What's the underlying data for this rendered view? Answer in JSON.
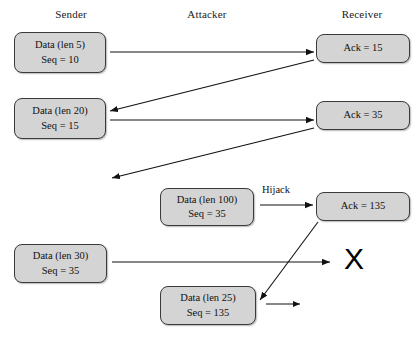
{
  "diagram": {
    "columns": [
      {
        "id": "sender",
        "label": "Sender",
        "x": 71,
        "y": 8
      },
      {
        "id": "attacker",
        "label": "Attacker",
        "x": 207,
        "y": 8
      },
      {
        "id": "receiver",
        "label": "Receiver",
        "x": 362,
        "y": 8
      }
    ],
    "boxes": [
      {
        "id": "sender-data-1",
        "line1": "Data (len 5)",
        "line2": "Seq = 10",
        "x": 14,
        "y": 32,
        "w": 92,
        "h": 41
      },
      {
        "id": "receiver-ack-1",
        "line1": "Ack = 15",
        "line2": "",
        "x": 316,
        "y": 34,
        "w": 94,
        "h": 29
      },
      {
        "id": "sender-data-2",
        "line1": "Data (len 20)",
        "line2": "Seq = 15",
        "x": 14,
        "y": 98,
        "w": 92,
        "h": 41
      },
      {
        "id": "receiver-ack-2",
        "line1": "Ack = 35",
        "line2": "",
        "x": 316,
        "y": 101,
        "w": 94,
        "h": 29
      },
      {
        "id": "attacker-data-1",
        "line1": "Data (len 100)",
        "line2": "Seq = 35",
        "x": 160,
        "y": 188,
        "w": 94,
        "h": 38
      },
      {
        "id": "receiver-ack-3",
        "line1": "Ack = 135",
        "line2": "",
        "x": 316,
        "y": 192,
        "w": 94,
        "h": 29
      },
      {
        "id": "sender-data-3",
        "line1": "Data (len 30)",
        "line2": "Seq = 35",
        "x": 14,
        "y": 244,
        "w": 93,
        "h": 39
      },
      {
        "id": "attacker-data-2",
        "line1": "Data (len 25)",
        "line2": "Seq = 135",
        "x": 160,
        "y": 286,
        "w": 96,
        "h": 39
      }
    ],
    "annotations": [
      {
        "id": "hijack",
        "text": "Hijack",
        "x": 262,
        "y": 184
      },
      {
        "id": "drop-x",
        "text": "X",
        "x": 344,
        "y": 244
      }
    ]
  }
}
